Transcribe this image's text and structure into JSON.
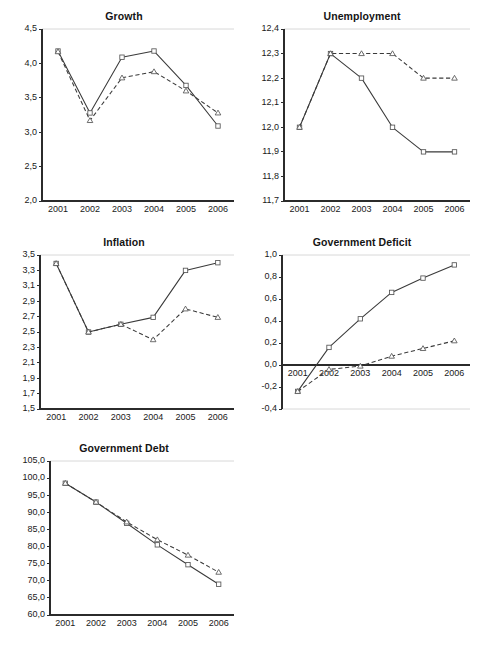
{
  "figure": {
    "background": "#ffffff",
    "line_color": "#3a3a3a",
    "marker_fill": "#ffffff",
    "gridline_color": "#d8d8d8",
    "axis_color": "#2b2b2b"
  },
  "chart_data": [
    {
      "type": "line",
      "title": "Growth",
      "xlabel": "",
      "ylabel": "",
      "x": [
        "2001",
        "2002",
        "2003",
        "2004",
        "2005",
        "2006"
      ],
      "categories": [
        "2001",
        "2002",
        "2003",
        "2004",
        "2005",
        "2006"
      ],
      "ylim": [
        2.0,
        4.5
      ],
      "yticks": [
        "2,0",
        "2,5",
        "3,0",
        "3,5",
        "4,0",
        "4,5"
      ],
      "ytick_values": [
        2.0,
        2.5,
        3.0,
        3.5,
        4.0,
        4.5
      ],
      "grid": "top-only",
      "legend": "none",
      "series": [
        {
          "name": "solid",
          "style": "solid",
          "marker": "square",
          "values": [
            4.18,
            3.28,
            4.09,
            4.18,
            3.68,
            3.09
          ]
        },
        {
          "name": "dashed",
          "style": "dashed",
          "marker": "triangle",
          "values": [
            4.17,
            3.17,
            3.79,
            3.88,
            3.6,
            3.28
          ]
        }
      ]
    },
    {
      "type": "line",
      "title": "Unemployment",
      "xlabel": "",
      "ylabel": "",
      "x": [
        "2001",
        "2002",
        "2003",
        "2004",
        "2005",
        "2006"
      ],
      "categories": [
        "2001",
        "2002",
        "2003",
        "2004",
        "2005",
        "2006"
      ],
      "ylim": [
        11.7,
        12.4
      ],
      "yticks": [
        "11,7",
        "11,8",
        "11,9",
        "12,0",
        "12,1",
        "12,2",
        "12,3",
        "12,4"
      ],
      "ytick_values": [
        11.7,
        11.8,
        11.9,
        12.0,
        12.1,
        12.2,
        12.3,
        12.4
      ],
      "grid": "top-only",
      "legend": "none",
      "series": [
        {
          "name": "solid",
          "style": "solid",
          "marker": "square",
          "values": [
            12.0,
            12.3,
            12.2,
            12.0,
            11.9,
            11.9
          ]
        },
        {
          "name": "dashed",
          "style": "dashed",
          "marker": "triangle",
          "values": [
            12.0,
            12.3,
            12.3,
            12.3,
            12.2,
            12.2
          ]
        }
      ]
    },
    {
      "type": "line",
      "title": "Inflation",
      "xlabel": "",
      "ylabel": "",
      "x": [
        "2001",
        "2002",
        "2003",
        "2004",
        "2005",
        "2006"
      ],
      "categories": [
        "2001",
        "2002",
        "2003",
        "2004",
        "2005",
        "2006"
      ],
      "ylim": [
        1.5,
        3.5
      ],
      "yticks": [
        "1,5",
        "1,7",
        "1,9",
        "2,1",
        "2,3",
        "2,5",
        "2,7",
        "2,9",
        "3,1",
        "3,3",
        "3,5"
      ],
      "ytick_values": [
        1.5,
        1.7,
        1.9,
        2.1,
        2.3,
        2.5,
        2.7,
        2.9,
        3.1,
        3.3,
        3.5
      ],
      "grid": "top-only",
      "legend": "none",
      "series": [
        {
          "name": "solid",
          "style": "solid",
          "marker": "square",
          "values": [
            3.39,
            2.5,
            2.6,
            2.69,
            3.3,
            3.4
          ]
        },
        {
          "name": "dashed",
          "style": "dashed",
          "marker": "triangle",
          "values": [
            3.39,
            2.5,
            2.6,
            2.4,
            2.8,
            2.69
          ]
        }
      ]
    },
    {
      "type": "line",
      "title": "Government Deficit",
      "xlabel": "",
      "ylabel": "",
      "x": [
        "2001",
        "2002",
        "2003",
        "2004",
        "2005",
        "2006"
      ],
      "categories": [
        "2001",
        "2002",
        "2003",
        "2004",
        "2005",
        "2006"
      ],
      "ylim": [
        -0.4,
        1.0
      ],
      "yticks": [
        "-0,4",
        "-0,2",
        "0,0",
        "0,2",
        "0,4",
        "0,6",
        "0,8",
        "1,0"
      ],
      "ytick_values": [
        -0.4,
        -0.2,
        0.0,
        0.2,
        0.4,
        0.6,
        0.8,
        1.0
      ],
      "grid": "top-and-bottom",
      "zero_axis": true,
      "legend": "none",
      "series": [
        {
          "name": "solid",
          "style": "solid",
          "marker": "square",
          "values": [
            -0.24,
            0.16,
            0.42,
            0.66,
            0.79,
            0.91
          ]
        },
        {
          "name": "dashed",
          "style": "dashed",
          "marker": "triangle",
          "values": [
            -0.24,
            -0.04,
            -0.01,
            0.08,
            0.15,
            0.22
          ]
        }
      ]
    },
    {
      "type": "line",
      "title": "Government Debt",
      "xlabel": "",
      "ylabel": "",
      "x": [
        "2001",
        "2002",
        "2003",
        "2004",
        "2005",
        "2006"
      ],
      "categories": [
        "2001",
        "2002",
        "2003",
        "2004",
        "2005",
        "2006"
      ],
      "ylim": [
        60.0,
        105.0
      ],
      "yticks": [
        "60,0",
        "65,0",
        "70,0",
        "75,0",
        "80,0",
        "85,0",
        "90,0",
        "95,0",
        "100,0",
        "105,0"
      ],
      "ytick_values": [
        60.0,
        65.0,
        70.0,
        75.0,
        80.0,
        85.0,
        90.0,
        95.0,
        100.0,
        105.0
      ],
      "grid": "top-only",
      "legend": "none",
      "series": [
        {
          "name": "solid",
          "style": "solid",
          "marker": "square",
          "values": [
            98.5,
            93.0,
            86.8,
            80.5,
            74.7,
            69.0
          ]
        },
        {
          "name": "dashed",
          "style": "dashed",
          "marker": "triangle",
          "values": [
            98.5,
            93.0,
            87.2,
            82.0,
            77.5,
            72.5
          ]
        }
      ]
    }
  ],
  "panels": [
    {
      "key": "growth",
      "title": "Growth",
      "left": 8,
      "top": 10,
      "width": 232,
      "height": 218,
      "plot_w": 232,
      "plot_h": 200,
      "label_w": 28
    },
    {
      "key": "unemployment",
      "title": "Unemployment",
      "left": 248,
      "top": 10,
      "width": 228,
      "height": 218,
      "plot_w": 228,
      "plot_h": 200,
      "label_w": 30
    },
    {
      "key": "inflation",
      "title": "Inflation",
      "left": 8,
      "top": 236,
      "width": 232,
      "height": 200,
      "plot_w": 232,
      "plot_h": 182,
      "label_w": 26
    },
    {
      "key": "deficit",
      "title": "Government Deficit",
      "left": 248,
      "top": 236,
      "width": 228,
      "height": 200,
      "plot_w": 228,
      "plot_h": 182,
      "label_w": 28
    },
    {
      "key": "debt",
      "title": "Government Debt",
      "left": 8,
      "top": 442,
      "width": 232,
      "height": 200,
      "plot_w": 232,
      "plot_h": 182,
      "label_w": 36
    }
  ]
}
